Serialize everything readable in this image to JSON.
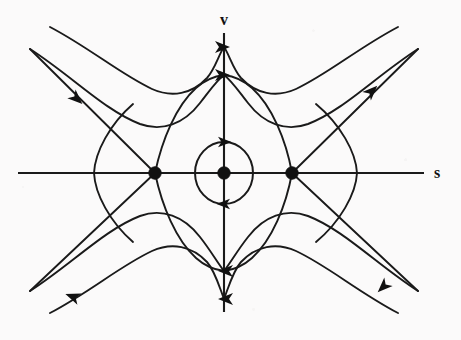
{
  "figure": {
    "background_color": "#fbfafa",
    "ink_color": "#1a1a1a",
    "width": 461,
    "height": 340
  },
  "axes": {
    "horizontal": {
      "label": "s",
      "label_x": 437,
      "label_y": 178,
      "x_start": 18,
      "x_end": 424,
      "y": 173
    },
    "vertical": {
      "label": "v",
      "label_x": 224,
      "label_y": 25,
      "y_start": 33,
      "y_end": 312,
      "x": 224
    }
  },
  "chart_data": {
    "type": "scatter",
    "xlabel": "s",
    "ylabel": "v",
    "grid": false,
    "legend": null,
    "origin_px": {
      "x": 224,
      "y": 173
    },
    "fixed_points": [
      {
        "name": "saddle-left",
        "kind": "saddle",
        "x_px": 155,
        "y_px": 173,
        "radius_px": 6.2
      },
      {
        "name": "center",
        "kind": "center",
        "x_px": 224,
        "y_px": 173,
        "radius_px": 6.2
      },
      {
        "name": "saddle-right",
        "kind": "saddle",
        "x_px": 292,
        "y_px": 173,
        "radius_px": 6.2
      }
    ],
    "closed_orbit": {
      "name": "periodic-orbit",
      "center_x_px": 224,
      "center_y_px": 173,
      "rx_px": 29,
      "ry_px": 31,
      "direction": "clockwise"
    },
    "separatrices": {
      "description": "Heteroclinic connections joining the two saddles, forming an eye-shaped region around the center",
      "upper_apex_y_px": 74,
      "lower_apex_y_px": 272
    },
    "flow_direction": {
      "upper_region": "rightward (positive v carries s to the right)",
      "lower_region": "leftward (negative v carries s to the left)"
    },
    "arrows": [
      {
        "name": "arrow-separatrix-top",
        "x_px": 224,
        "y_px": 75,
        "angle_deg": 0,
        "direction": "right"
      },
      {
        "name": "arrow-upper-outer-crossing",
        "x_px": 224,
        "y_px": 47,
        "angle_deg": 0,
        "direction": "right"
      },
      {
        "name": "arrow-orbit-top",
        "x_px": 222,
        "y_px": 143,
        "angle_deg": 0,
        "direction": "right"
      },
      {
        "name": "arrow-orbit-bottom",
        "x_px": 226,
        "y_px": 203,
        "angle_deg": 180,
        "direction": "left"
      },
      {
        "name": "arrow-separatrix-bottom",
        "x_px": 224,
        "y_px": 271,
        "angle_deg": 180,
        "direction": "left"
      },
      {
        "name": "arrow-lower-outer-crossing",
        "x_px": 224,
        "y_px": 299,
        "angle_deg": 180,
        "direction": "left"
      },
      {
        "name": "arrow-upper-left-incoming",
        "x_px": 76,
        "y_px": 99,
        "angle_deg": 38,
        "direction": "down-right"
      },
      {
        "name": "arrow-upper-right-outgoing",
        "x_px": 372,
        "y_px": 89,
        "angle_deg": -38,
        "direction": "up-right"
      },
      {
        "name": "arrow-lower-left-outgoing",
        "x_px": 70,
        "y_px": 296,
        "angle_deg": 208,
        "direction": "down-left"
      },
      {
        "name": "arrow-lower-right-incoming",
        "x_px": 381,
        "y_px": 288,
        "angle_deg": 143,
        "direction": "down-left"
      }
    ],
    "trajectories": [
      {
        "name": "upper-outer-wave",
        "note": "wavy curve above separatrix, enters upper-left, dips at s<0, peaks across v axis, exits upper-right"
      },
      {
        "name": "lower-outer-wave",
        "note": "mirror wavy curve below separatrix, enters lower-right, exits lower-left"
      },
      {
        "name": "saddle-unstable-left",
        "note": "straight branch leaving left saddle toward upper-left"
      },
      {
        "name": "saddle-stable-left",
        "note": "straight branch entering left saddle from lower-left"
      },
      {
        "name": "saddle-unstable-right",
        "note": "straight branch leaving right saddle toward upper-right"
      },
      {
        "name": "saddle-stable-right",
        "note": "straight branch entering right saddle from lower-right"
      },
      {
        "name": "left-outer-hyperbola",
        "note": "leftward-opening curve crossing s axis near s far left"
      },
      {
        "name": "right-outer-hyperbola",
        "note": "rightward-opening curve crossing s axis near s far right"
      }
    ]
  }
}
